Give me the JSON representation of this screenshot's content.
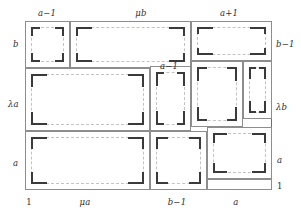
{
  "figure": {
    "kind": "squared-rectangle-dissection",
    "stroke_color": "#8d8d8d",
    "frame_color": "#6f6f6f",
    "dashed_color": "#c3c3c3",
    "tick_color": "#3a3a3a",
    "background": "#ffffff"
  },
  "labels": {
    "top": [
      {
        "text": "a−1",
        "x": 47,
        "y": 9
      },
      {
        "text": "μb",
        "x": 141,
        "y": 9
      },
      {
        "text": "a+1",
        "x": 229,
        "y": 9
      }
    ],
    "left": [
      {
        "text": "b",
        "x": 13,
        "y": 44
      },
      {
        "text": "λa",
        "x": 8,
        "y": 104
      },
      {
        "text": "a",
        "x": 13,
        "y": 163
      }
    ],
    "right": [
      {
        "text": "b−1",
        "x": 276,
        "y": 44
      },
      {
        "text": "λb",
        "x": 276,
        "y": 107
      },
      {
        "text": "a",
        "x": 277,
        "y": 160
      },
      {
        "text": "1",
        "x": 277,
        "y": 186,
        "upright": true
      }
    ],
    "bottom": [
      {
        "text": "1",
        "x": 29,
        "y": 198,
        "upright": true
      },
      {
        "text": "μa",
        "x": 85,
        "y": 198
      },
      {
        "text": "b−1",
        "x": 177,
        "y": 198
      },
      {
        "text": "a",
        "x": 236,
        "y": 198
      }
    ],
    "interior": [
      {
        "text": "a−1",
        "x": 169,
        "y": 62
      }
    ]
  },
  "frame": {
    "x": 25,
    "y": 21,
    "w": 247,
    "h": 169
  },
  "cells": [
    {
      "name": "cell-a-minus-1-top-left",
      "x": 25,
      "y": 21,
      "w": 45,
      "h": 47
    },
    {
      "name": "cell-mu-b",
      "x": 70,
      "y": 21,
      "w": 121,
      "h": 47
    },
    {
      "name": "cell-a-plus-1",
      "x": 191,
      "y": 21,
      "w": 81,
      "h": 40
    },
    {
      "name": "cell-lambda-a",
      "x": 25,
      "y": 68,
      "w": 125,
      "h": 63
    },
    {
      "name": "cell-a-minus-1-middle",
      "x": 150,
      "y": 66,
      "w": 41,
      "h": 65
    },
    {
      "name": "cell-lambda-b-inner",
      "x": 191,
      "y": 61,
      "w": 52,
      "h": 66
    },
    {
      "name": "cell-lambda-b-strip",
      "x": 243,
      "y": 61,
      "w": 29,
      "h": 58
    },
    {
      "name": "cell-mu-a",
      "x": 25,
      "y": 131,
      "w": 125,
      "h": 59
    },
    {
      "name": "cell-b-minus-1",
      "x": 150,
      "y": 131,
      "w": 57,
      "h": 59
    },
    {
      "name": "cell-a-bottom-right",
      "x": 207,
      "y": 127,
      "w": 65,
      "h": 52
    },
    {
      "name": "cell-one-strip",
      "x": 207,
      "y": 179,
      "w": 65,
      "h": 11
    }
  ],
  "ghosts": [
    {
      "x": 31,
      "y": 27,
      "w": 33,
      "h": 35
    },
    {
      "x": 76,
      "y": 27,
      "w": 109,
      "h": 35
    },
    {
      "x": 197,
      "y": 27,
      "w": 69,
      "h": 28
    },
    {
      "x": 31,
      "y": 74,
      "w": 113,
      "h": 51
    },
    {
      "x": 156,
      "y": 72,
      "w": 29,
      "h": 53
    },
    {
      "x": 197,
      "y": 67,
      "w": 40,
      "h": 54
    },
    {
      "x": 249,
      "y": 67,
      "w": 17,
      "h": 46
    },
    {
      "x": 31,
      "y": 137,
      "w": 113,
      "h": 47
    },
    {
      "x": 156,
      "y": 137,
      "w": 45,
      "h": 47
    },
    {
      "x": 213,
      "y": 133,
      "w": 53,
      "h": 40
    }
  ]
}
